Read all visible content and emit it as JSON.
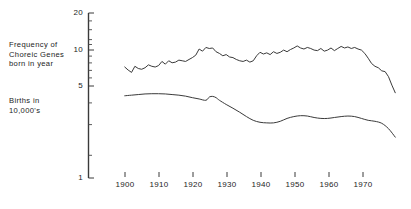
{
  "chart_data": {
    "type": "line",
    "title": "",
    "subtitle": "",
    "xlabel": "",
    "ylabel": "",
    "yscale": "log",
    "xlim": [
      1893,
      1977
    ],
    "ylim": [
      1,
      20
    ],
    "grid": false,
    "legend_position": "inline-left-labels",
    "y_ticks_major": [
      1,
      5,
      10,
      20
    ],
    "y_tick_labels": [
      "1",
      "5",
      "10",
      "20"
    ],
    "y_ticks_minor": [
      2,
      3,
      4,
      6,
      7,
      8,
      9,
      12,
      14,
      16,
      18
    ],
    "x_ticks": [
      1900,
      1910,
      1920,
      1930,
      1940,
      1950,
      1960,
      1970
    ],
    "x_tick_labels": [
      "1900",
      "1910",
      "1920",
      "1930",
      "1940",
      "1950",
      "1960",
      "1970"
    ],
    "series": [
      {
        "name": "Frequency of Choreic Genes born in year",
        "label_lines": [
          "Frequency  of",
          "Choreic  Genes",
          "born in year"
        ],
        "color": "#3a3a3a",
        "x": [
          1895,
          1896,
          1897,
          1898,
          1899,
          1900,
          1901,
          1902,
          1903,
          1904,
          1905,
          1906,
          1907,
          1908,
          1909,
          1910,
          1911,
          1912,
          1913,
          1914,
          1915,
          1916,
          1917,
          1918,
          1919,
          1920,
          1921,
          1922,
          1923,
          1924,
          1925,
          1926,
          1927,
          1928,
          1929,
          1930,
          1931,
          1932,
          1933,
          1934,
          1935,
          1936,
          1937,
          1938,
          1939,
          1940,
          1941,
          1942,
          1943,
          1944,
          1945,
          1946,
          1947,
          1948,
          1949,
          1950,
          1951,
          1952,
          1953,
          1954,
          1955,
          1956,
          1957,
          1958,
          1959,
          1960,
          1961,
          1962,
          1963,
          1964,
          1965,
          1966,
          1967,
          1968,
          1969,
          1970,
          1971,
          1972,
          1973,
          1974,
          1975
        ],
        "y": [
          7.5,
          7.1,
          6.8,
          7.6,
          7.3,
          7.2,
          7.4,
          7.8,
          7.6,
          7.5,
          7.7,
          8.3,
          7.9,
          8.4,
          8.1,
          8.2,
          8.5,
          8.4,
          8.3,
          8.6,
          8.9,
          9.3,
          10.4,
          10.0,
          10.7,
          10.5,
          10.6,
          9.9,
          9.6,
          9.2,
          9.4,
          9.0,
          8.9,
          8.6,
          8.4,
          8.3,
          8.5,
          8.2,
          8.4,
          9.2,
          9.8,
          9.5,
          9.7,
          9.4,
          9.9,
          9.6,
          9.8,
          10.2,
          9.9,
          10.3,
          10.6,
          11.0,
          10.6,
          10.4,
          10.7,
          10.5,
          10.2,
          10.1,
          10.5,
          10.0,
          10.2,
          10.6,
          10.1,
          10.5,
          10.9,
          10.6,
          10.8,
          10.5,
          10.7,
          10.4,
          10.2,
          9.6,
          8.8,
          8.0,
          7.6,
          7.4,
          7.0,
          6.9,
          6.3,
          5.4,
          4.7
        ]
      },
      {
        "name": "Births in 10,000's",
        "label_lines": [
          "Births  in",
          "10,000's"
        ],
        "color": "#3a3a3a",
        "x": [
          1895,
          1897,
          1899,
          1901,
          1903,
          1905,
          1907,
          1909,
          1911,
          1913,
          1915,
          1917,
          1919,
          1920,
          1921,
          1922,
          1923,
          1925,
          1927,
          1929,
          1931,
          1933,
          1935,
          1937,
          1939,
          1941,
          1943,
          1945,
          1947,
          1949,
          1951,
          1953,
          1955,
          1957,
          1959,
          1961,
          1963,
          1965,
          1967,
          1969,
          1971,
          1973,
          1975
        ],
        "y": [
          4.45,
          4.5,
          4.55,
          4.6,
          4.62,
          4.62,
          4.6,
          4.55,
          4.5,
          4.42,
          4.3,
          4.2,
          4.1,
          4.35,
          4.4,
          4.3,
          4.1,
          3.8,
          3.55,
          3.3,
          3.05,
          2.85,
          2.75,
          2.72,
          2.72,
          2.8,
          2.95,
          3.05,
          3.1,
          3.08,
          3.0,
          2.95,
          2.95,
          3.0,
          3.05,
          3.08,
          3.05,
          2.95,
          2.85,
          2.8,
          2.7,
          2.45,
          2.1
        ]
      }
    ]
  },
  "axis_labels": {
    "y_20": "20",
    "y_10": "10",
    "y_5": "5",
    "y_1": "1",
    "x_1900": "1900",
    "x_1910": "1910",
    "x_1920": "1920",
    "x_1930": "1930",
    "x_1940": "1940",
    "x_1950": "1950",
    "x_1960": "1960",
    "x_1970": "1970"
  },
  "series_labels": {
    "top_l1": "Frequency  of",
    "top_l2": "Choreic  Genes",
    "top_l3": "born in year",
    "bottom_l1": "Births  in",
    "bottom_l2": "10,000's"
  }
}
